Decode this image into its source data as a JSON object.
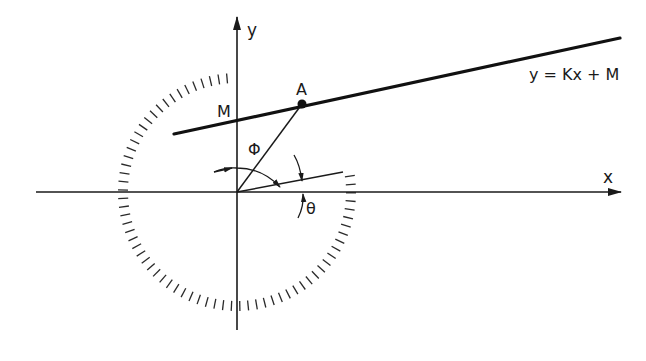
{
  "diagram": {
    "type": "geometry",
    "labels": {
      "x_axis": "x",
      "y_axis": "y",
      "line_equation": "y = Kx + M",
      "intercept": "M",
      "point": "A",
      "phi": "Φ",
      "theta": "θ"
    },
    "elements": [
      {
        "id": "x-axis",
        "kind": "axis",
        "label": "x"
      },
      {
        "id": "y-axis",
        "kind": "axis",
        "label": "y"
      },
      {
        "id": "line",
        "kind": "line",
        "equation": "y = Kx + M"
      },
      {
        "id": "point-A",
        "kind": "point",
        "label": "A",
        "on": "line"
      },
      {
        "id": "segment-OA",
        "kind": "segment",
        "from": "origin",
        "to": "A"
      },
      {
        "id": "ray-theta",
        "kind": "ray",
        "from": "origin"
      },
      {
        "id": "angle-phi",
        "kind": "angle",
        "label": "Φ",
        "between": [
          "y-axis",
          "segment-OA"
        ]
      },
      {
        "id": "angle-theta",
        "kind": "angle",
        "label": "θ",
        "between": [
          "x-axis",
          "ray-theta"
        ]
      },
      {
        "id": "tick-circle",
        "kind": "dashed-circle",
        "center": "origin"
      }
    ],
    "colors": {
      "ink": "#1a1a1a",
      "background": "#ffffff"
    }
  }
}
